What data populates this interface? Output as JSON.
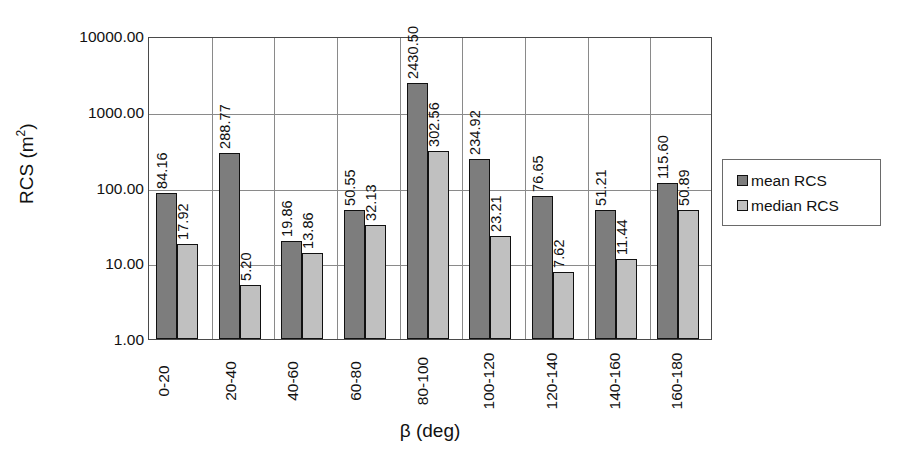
{
  "chart_data": {
    "type": "bar",
    "title": "",
    "xlabel": "β (deg)",
    "ylabel": "RCS (m2)",
    "ylabel_base": "RCS (m",
    "ylabel_sup": "2",
    "ylabel_tail": ")",
    "yscale": "log",
    "ylim": [
      1,
      10000
    ],
    "grid": true,
    "legend_position": "right",
    "categories": [
      "0-20",
      "20-40",
      "40-60",
      "60-80",
      "80-100",
      "100-120",
      "120-140",
      "140-160",
      "160-180"
    ],
    "y_ticks": [
      "1.00",
      "10.00",
      "100.00",
      "1000.00",
      "10000.00"
    ],
    "y_tick_values": [
      1,
      10,
      100,
      1000,
      10000
    ],
    "series": [
      {
        "name": "mean RCS",
        "color": "#7d7d7d",
        "values": [
          84.16,
          288.77,
          19.86,
          50.55,
          2430.5,
          234.92,
          76.65,
          51.21,
          115.6
        ],
        "labels": [
          "84.16",
          "288.77",
          "19.86",
          "50.55",
          "2430.50",
          "234.92",
          "76.65",
          "51.21",
          "115.60"
        ]
      },
      {
        "name": "median RCS",
        "color": "#c0c0c0",
        "values": [
          17.92,
          5.2,
          13.86,
          32.13,
          302.56,
          23.21,
          7.62,
          11.44,
          50.89
        ],
        "labels": [
          "17.92",
          "5.20",
          "13.86",
          "32.13",
          "302.56",
          "23.21",
          "7.62",
          "11.44",
          "50.89"
        ]
      }
    ]
  },
  "legend": {
    "items": [
      {
        "label": "mean RCS",
        "color": "#7d7d7d"
      },
      {
        "label": "median RCS",
        "color": "#c0c0c0"
      }
    ]
  },
  "axes": {
    "y_title": "RCS (m2)",
    "x_title": "β (deg)"
  },
  "colors": {
    "mean": "#7d7d7d",
    "median": "#c0c0c0",
    "grid": "#8a8a8a",
    "axis": "#4a4a4a",
    "text": "#111111",
    "background": "#ffffff"
  }
}
